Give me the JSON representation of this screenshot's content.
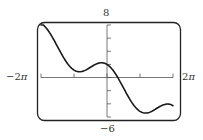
{
  "chart_data": {
    "type": "line",
    "title": "",
    "xlabel": "",
    "ylabel": "",
    "function": "f(x) = -x + 2cos(x)",
    "xlim": [
      -6.2832,
      6.2832
    ],
    "ylim": [
      -6,
      8
    ],
    "x_tick_labels": [
      "-2π",
      "2π"
    ],
    "y_tick_labels": [
      "8",
      "-6"
    ],
    "x_ticks": [
      -6.2832,
      -3.1416,
      0,
      3.1416,
      6.2832
    ],
    "y_ticks": [
      -6,
      -4,
      -2,
      0,
      2,
      4,
      6,
      8
    ],
    "grid": false,
    "legend": null,
    "series": [
      {
        "name": "curve",
        "x": [
          -6.2832,
          -5.4978,
          -4.7124,
          -3.927,
          -3.1416,
          -2.3562,
          -1.5708,
          -0.7854,
          0,
          0.7854,
          1.5708,
          2.3562,
          3.1416,
          3.927,
          4.7124,
          5.4978,
          6.2832
        ],
        "y": [
          8.28,
          6.91,
          4.71,
          2.51,
          1.14,
          0.94,
          1.57,
          2.2,
          2.0,
          0.63,
          -1.57,
          -3.77,
          -5.14,
          -5.34,
          -4.71,
          -4.08,
          -4.28
        ]
      }
    ]
  },
  "labels": {
    "y_max": "8",
    "y_min": "−6",
    "x_min_prefix": "−2",
    "x_max_prefix": "2",
    "pi": "π"
  },
  "colors": {
    "curve": "#1a1a1a",
    "frame": "#222222",
    "axes": "#555555"
  }
}
